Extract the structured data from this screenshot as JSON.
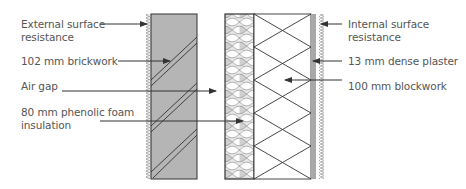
{
  "colors": {
    "line": "#333333",
    "text": "#555555",
    "brick_fill": "#b5b5b5",
    "plaster_fill": "#a8a8a8",
    "insulation_cell": "#d6d6d6",
    "hatch": "#9a9a9a"
  },
  "labels": {
    "left": [
      {
        "id": "external_surface_resistance",
        "lines": [
          "External surface",
          "resistance"
        ]
      },
      {
        "id": "brickwork",
        "lines": [
          "102 mm brickwork"
        ]
      },
      {
        "id": "air_gap",
        "lines": [
          "Air gap"
        ]
      },
      {
        "id": "insulation",
        "lines": [
          "80 mm phenolic foam",
          "insulation"
        ]
      }
    ],
    "right": [
      {
        "id": "internal_surface_resistance",
        "lines": [
          "Internal surface",
          "resistance"
        ]
      },
      {
        "id": "plaster",
        "lines": [
          "13 mm dense plaster"
        ]
      },
      {
        "id": "blockwork",
        "lines": [
          "100 mm blockwork"
        ]
      }
    ]
  },
  "layers": [
    {
      "name": "External surface resistance",
      "pattern": "zigzag-hatch"
    },
    {
      "name": "102 mm brickwork",
      "pattern": "grey-with-diagonal-double-lines"
    },
    {
      "name": "Air gap",
      "pattern": "empty"
    },
    {
      "name": "80 mm phenolic foam insulation",
      "pattern": "honeycomb"
    },
    {
      "name": "100 mm blockwork",
      "pattern": "cross-diagonals"
    },
    {
      "name": "13 mm dense plaster",
      "pattern": "grey-strip"
    },
    {
      "name": "Internal surface resistance",
      "pattern": "zigzag-hatch"
    }
  ]
}
